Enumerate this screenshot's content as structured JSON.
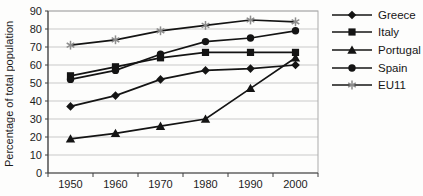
{
  "chart_data": {
    "type": "line",
    "x": [
      1950,
      1960,
      1970,
      1980,
      1990,
      2000
    ],
    "series": [
      {
        "name": "Greece",
        "marker": "diamond",
        "line_color": "#141414",
        "marker_color": "#141414",
        "values": [
          37,
          43,
          52,
          57,
          58,
          60
        ]
      },
      {
        "name": "Italy",
        "marker": "square",
        "line_color": "#141414",
        "marker_color": "#141414",
        "values": [
          54,
          59,
          64,
          67,
          67,
          67
        ]
      },
      {
        "name": "Portugal",
        "marker": "triangle",
        "line_color": "#141414",
        "marker_color": "#141414",
        "values": [
          19,
          22,
          26,
          30,
          47,
          64
        ]
      },
      {
        "name": "Spain",
        "marker": "circle",
        "line_color": "#141414",
        "marker_color": "#141414",
        "values": [
          52,
          57,
          66,
          73,
          75,
          79
        ]
      },
      {
        "name": "EU11",
        "marker": "asterisk",
        "line_color": "#141414",
        "marker_color": "#8d8d8d",
        "values": [
          71,
          74,
          79,
          82,
          85,
          84
        ]
      }
    ],
    "title": "",
    "xlabel": "",
    "ylabel": "Percentage of total population",
    "ylim": [
      0,
      90
    ],
    "ytick_step": 10,
    "grid": true,
    "legend_position": "right",
    "colors": {
      "grid": "#c9c9c9",
      "axis": "#3f3f3f",
      "plot_border": "#ababab",
      "tick_text": "#1c1c1c",
      "background": "#fdfdfc"
    }
  }
}
